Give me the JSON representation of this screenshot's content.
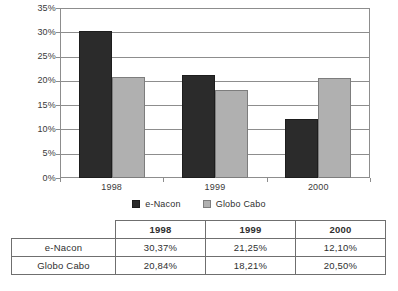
{
  "chart_data": {
    "type": "bar",
    "title": "",
    "subtitle": "",
    "xlabel": "",
    "ylabel": "",
    "categories": [
      "1998",
      "1999",
      "2000"
    ],
    "series": [
      {
        "name": "e-Nacon",
        "values": [
          30.37,
          21.25,
          12.1
        ],
        "color": "#2b2b2b"
      },
      {
        "name": "Globo Cabo",
        "values": [
          20.84,
          18.21,
          20.5
        ],
        "color": "#b0b0b0"
      }
    ],
    "ylim": [
      0,
      35
    ],
    "ytick_step": 5,
    "ytick_labels": [
      "35%",
      "30%",
      "25%",
      "20%",
      "15%",
      "10%",
      "5%",
      "0%"
    ],
    "grid": true,
    "grid_axis": "y",
    "legend_position": "bottom-center"
  },
  "legend": {
    "items": [
      {
        "label": "e-Nacon",
        "color": "#2b2b2b"
      },
      {
        "label": "Globo Cabo",
        "color": "#b0b0b0"
      }
    ]
  },
  "table": {
    "corner_label": "",
    "column_headers": [
      "1998",
      "1999",
      "2000"
    ],
    "rows": [
      {
        "label": "e-Nacon",
        "cells": [
          "30,37%",
          "21,25%",
          "12,10%"
        ]
      },
      {
        "label": "Globo Cabo",
        "cells": [
          "20,84%",
          "18,21%",
          "20,50%"
        ]
      }
    ]
  }
}
